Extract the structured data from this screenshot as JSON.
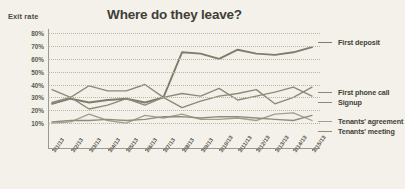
{
  "chart": {
    "title": "Where do they leave?",
    "ylabel": "Exit rate"
  },
  "chart_data": {
    "type": "line",
    "title": "Where do they leave?",
    "xlabel": "",
    "ylabel": "Exit rate",
    "ylim": [
      0,
      80
    ],
    "yticks": [
      "10%",
      "20%",
      "30%",
      "40%",
      "50%",
      "60%",
      "70%",
      "80%"
    ],
    "ytick_values": [
      10,
      20,
      30,
      40,
      50,
      60,
      70,
      80
    ],
    "grid": "horizontal-dotted",
    "legend_position": "right",
    "categories": [
      "3/1/13",
      "3/2/13",
      "3/3/13",
      "3/4/13",
      "3/5/13",
      "3/6/13",
      "3/7/13",
      "3/8/13",
      "3/9/13",
      "3/10/13",
      "3/11/13",
      "3/12/13",
      "3/13/13",
      "3/14/13",
      "3/15/13"
    ],
    "series": [
      {
        "name": "First deposit",
        "color": "#7d7d6c",
        "values": [
          25,
          29,
          26,
          28,
          29,
          26,
          30,
          65,
          64,
          60,
          67,
          64,
          63,
          65,
          69
        ]
      },
      {
        "name": "First phone call",
        "color": "#8a8a78",
        "values": [
          36,
          30,
          39,
          35,
          35,
          40,
          30,
          22,
          27,
          31,
          33,
          36,
          25,
          30,
          38
        ]
      },
      {
        "name": "Signup",
        "color": "#8a8a78",
        "values": [
          26,
          30,
          21,
          24,
          29,
          24,
          30,
          33,
          31,
          37,
          28,
          31,
          34,
          38,
          31
        ]
      },
      {
        "name": "Tenants' agreement",
        "color": "#a0a08e",
        "values": [
          10,
          11,
          17,
          12,
          10,
          16,
          14,
          17,
          13,
          13,
          14,
          12,
          17,
          18,
          12
        ]
      },
      {
        "name": "Tenants' meeting",
        "color": "#8d8d7c",
        "values": [
          11,
          12,
          12,
          13,
          12,
          13,
          15,
          15,
          14,
          15,
          15,
          14,
          13,
          12,
          16
        ]
      }
    ],
    "legend_entries": [
      {
        "label": "First deposit",
        "top_px": 38
      },
      {
        "label": "First phone call",
        "top_px": 88
      },
      {
        "label": "Signup",
        "top_px": 98
      },
      {
        "label": "Tenants' agreement",
        "top_px": 117
      },
      {
        "label": "Tenants' meeting",
        "top_px": 127
      }
    ]
  }
}
